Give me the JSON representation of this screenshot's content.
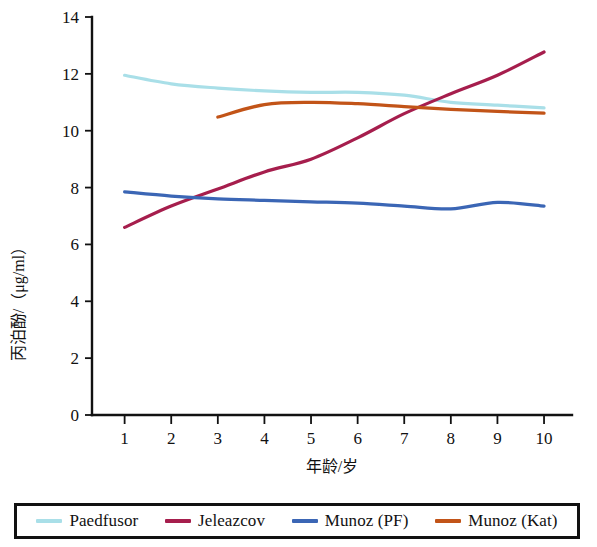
{
  "chart_data": {
    "type": "line",
    "title": "",
    "xlabel": "年龄/岁",
    "ylabel": "丙泊酚/（μg/ml）",
    "xlim": [
      0.3,
      10.6
    ],
    "ylim": [
      0,
      14
    ],
    "xticks": [
      "1",
      "2",
      "3",
      "4",
      "5",
      "6",
      "7",
      "8",
      "9",
      "10"
    ],
    "xtick_values": [
      1,
      2,
      3,
      4,
      5,
      6,
      7,
      8,
      9,
      10
    ],
    "yticks": [
      "0",
      "2",
      "4",
      "6",
      "8",
      "10",
      "12",
      "14"
    ],
    "ytick_values": [
      0,
      2,
      4,
      6,
      8,
      10,
      12,
      14
    ],
    "grid": false,
    "legend_position": "bottom",
    "x": [
      1,
      2,
      3,
      4,
      5,
      6,
      7,
      8,
      9,
      10
    ],
    "series": [
      {
        "name": "Paedfusor",
        "color": "#a9dfe8",
        "x": [
          1,
          2,
          3,
          4,
          5,
          6,
          7,
          8,
          9,
          10
        ],
        "values": [
          11.95,
          11.65,
          11.5,
          11.4,
          11.35,
          11.35,
          11.25,
          11.0,
          10.9,
          10.8
        ]
      },
      {
        "name": "Jeleazcov",
        "color": "#a61e4d",
        "x": [
          1,
          2,
          3,
          4,
          5,
          6,
          7,
          8,
          9,
          10
        ],
        "values": [
          6.6,
          7.35,
          7.95,
          8.55,
          9.0,
          9.75,
          10.6,
          11.3,
          11.95,
          12.77
        ]
      },
      {
        "name": "Munoz (PF)",
        "color": "#3b66b5",
        "x": [
          1,
          2,
          3,
          4,
          5,
          6,
          7,
          8,
          9,
          10
        ],
        "values": [
          7.85,
          7.7,
          7.6,
          7.55,
          7.5,
          7.45,
          7.35,
          7.25,
          7.48,
          7.35
        ]
      },
      {
        "name": "Munoz (Kat)",
        "color": "#c25418",
        "x": [
          3,
          4,
          5,
          6,
          7,
          8,
          9,
          10
        ],
        "values": [
          10.48,
          10.92,
          11.0,
          10.95,
          10.85,
          10.75,
          10.68,
          10.62
        ]
      }
    ]
  },
  "legend": {
    "items": [
      {
        "label": "Paedfusor",
        "color": "#a9dfe8"
      },
      {
        "label": "Jeleazcov",
        "color": "#a61e4d"
      },
      {
        "label": "Munoz (PF)",
        "color": "#3b66b5"
      },
      {
        "label": "Munoz (Kat)",
        "color": "#c25418"
      }
    ]
  },
  "axes": {
    "y_title": "丙泊酚/（μg/ml）",
    "x_title": "年龄/岁"
  }
}
